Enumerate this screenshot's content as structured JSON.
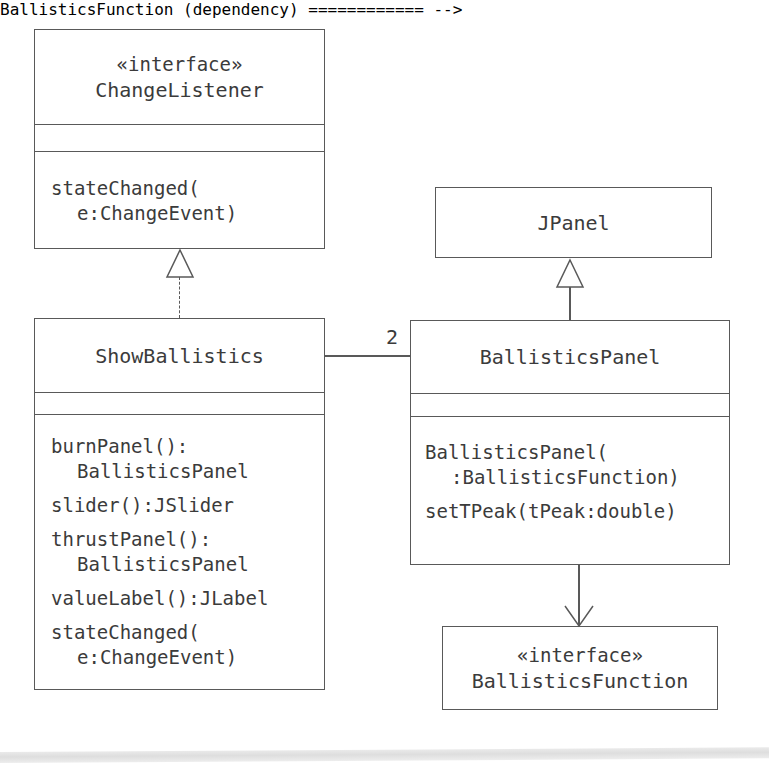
{
  "diagram": {
    "type": "uml-class-diagram",
    "stroke_color": "#595959",
    "text_color": "#3b3b3b",
    "background": "#ffffff",
    "classes": [
      {
        "id": "changelistener",
        "stereotype": "«interface»",
        "name": "ChangeListener",
        "attributes": [],
        "methods": [
          {
            "line1": "stateChanged(",
            "line2": "e:ChangeEvent)"
          }
        ]
      },
      {
        "id": "jpanel",
        "stereotype": "",
        "name": "JPanel",
        "attributes": [],
        "methods": []
      },
      {
        "id": "showballistics",
        "stereotype": "",
        "name": "ShowBallistics",
        "attributes": [],
        "methods": [
          {
            "line1": "burnPanel():",
            "line2": "BallisticsPanel"
          },
          {
            "line1": "slider():JSlider",
            "line2": ""
          },
          {
            "line1": "thrustPanel():",
            "line2": "BallisticsPanel"
          },
          {
            "line1": "valueLabel():JLabel",
            "line2": ""
          },
          {
            "line1": "stateChanged(",
            "line2": "e:ChangeEvent)"
          }
        ]
      },
      {
        "id": "ballisticspanel",
        "stereotype": "",
        "name": "BallisticsPanel",
        "attributes": [],
        "methods": [
          {
            "line1": "BallisticsPanel(",
            "line2": ":BallisticsFunction)"
          },
          {
            "line1": "setTPeak(tPeak:double)",
            "line2": ""
          }
        ]
      },
      {
        "id": "ballisticsfunction",
        "stereotype": "«interface»",
        "name": "BallisticsFunction",
        "attributes": [],
        "methods": []
      }
    ],
    "relationships": [
      {
        "id": "realization-showballistics-changelistener",
        "kind": "realization",
        "style": "dashed",
        "arrowhead": "hollow-triangle",
        "from": "ShowBallistics",
        "to": "ChangeListener",
        "label": ""
      },
      {
        "id": "generalization-ballisticspanel-jpanel",
        "kind": "generalization",
        "style": "solid",
        "arrowhead": "hollow-triangle",
        "from": "BallisticsPanel",
        "to": "JPanel",
        "label": ""
      },
      {
        "id": "association-showballistics-ballisticspanel",
        "kind": "association",
        "style": "solid",
        "arrowhead": "none",
        "from": "ShowBallistics",
        "to": "BallisticsPanel",
        "label": "2"
      },
      {
        "id": "dependency-ballisticspanel-ballisticsfunction",
        "kind": "dependency",
        "style": "solid",
        "arrowhead": "open-arrow",
        "from": "BallisticsPanel",
        "to": "BallisticsFunction",
        "label": ""
      }
    ]
  }
}
